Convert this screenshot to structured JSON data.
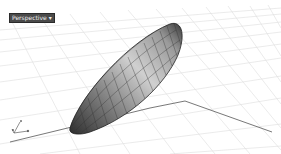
{
  "viewport": {
    "label": "Perspective",
    "label_suffix": "▾",
    "background": "#ffffff",
    "grid_color": "#d8d8d8",
    "axis_color": "#555555"
  },
  "object": {
    "type": "ellipsoid-surface",
    "shade_dark": "#2e2e2e",
    "shade_light": "#d9d9d9"
  },
  "gizmo": {
    "axes": [
      "x",
      "y",
      "z"
    ]
  }
}
